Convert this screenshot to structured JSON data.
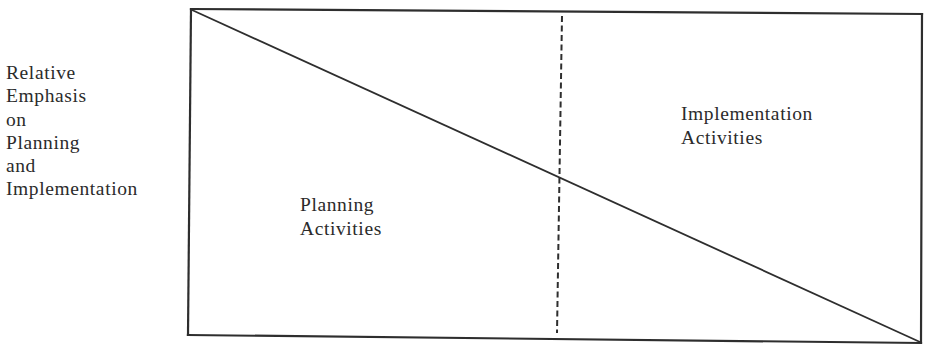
{
  "diagram": {
    "y_axis_label": {
      "lines": [
        "Relative",
        "Emphasis",
        "on",
        "Planning",
        "and",
        "Implementation"
      ]
    },
    "regions": {
      "planning": {
        "lines": [
          "Planning",
          "Activities"
        ]
      },
      "implementation": {
        "lines": [
          "Implementation",
          "Activities"
        ]
      }
    },
    "colors": {
      "line": "#2e2e2e",
      "background": "#ffffff",
      "text": "#2b2b2b"
    }
  }
}
